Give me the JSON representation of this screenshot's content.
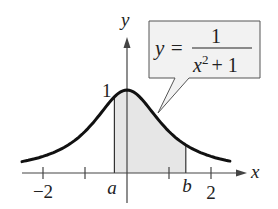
{
  "chart_data": {
    "type": "area",
    "title": "",
    "function": "y = 1/(x^2 + 1)",
    "xlabel": "x",
    "ylabel": "y",
    "xlim": [
      -2.5,
      2.75
    ],
    "ylim": [
      0,
      1.3
    ],
    "x_ticks": [
      -2,
      -1,
      1,
      2
    ],
    "x_tick_labels": [
      "−2",
      "2"
    ],
    "y_tick_labels": [
      "1"
    ],
    "shaded_region": {
      "from_label": "a",
      "to_label": "b",
      "from": -0.3,
      "to": 1.4
    },
    "grid": false,
    "annotation": {
      "lhs": "y =",
      "numerator": "1",
      "denominator_base": "x",
      "denominator_exp": "2",
      "denominator_rest": "+ 1"
    },
    "colors": {
      "curve": "#111111",
      "shade": "#e6e6e6",
      "axis": "#444444"
    }
  },
  "labels": {
    "x_axis": "x",
    "y_axis": "y",
    "tick_neg2": "−2",
    "tick_2": "2",
    "tick_y1": "1",
    "a": "a",
    "b": "b",
    "eq_lhs": "y =",
    "eq_num": "1",
    "eq_den_base": "x",
    "eq_den_exp": "2",
    "eq_den_rest": "+ 1"
  }
}
